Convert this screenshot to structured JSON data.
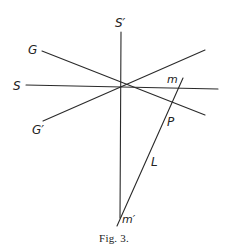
{
  "figure": {
    "caption": "Fig. 3.",
    "colors": {
      "line": "#2a2a2a",
      "text": "#222222",
      "background": "#ffffff"
    },
    "labels": {
      "s_prime": "S′",
      "g": "G",
      "s": "S",
      "g_prime": "G′",
      "m": "m",
      "p": "P",
      "l": "L",
      "m_prime": "m′"
    },
    "lines": [
      {
        "name": "S-prime-axis",
        "from": [
          121,
          32
        ],
        "to": [
          120,
          218
        ]
      },
      {
        "name": "S-axis",
        "from": [
          26,
          85
        ],
        "to": [
          218,
          89
        ]
      },
      {
        "name": "G-line",
        "from": [
          42,
          51
        ],
        "to": [
          205,
          115
        ]
      },
      {
        "name": "G-prime-line",
        "from": [
          43,
          121
        ],
        "to": [
          205,
          50
        ]
      },
      {
        "name": "L-line",
        "from": [
          183,
          78
        ],
        "to": [
          117,
          226
        ]
      }
    ],
    "center": [
      121,
      88
    ]
  }
}
